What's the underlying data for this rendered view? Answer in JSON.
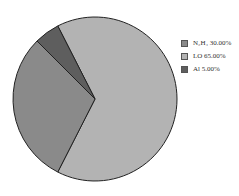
{
  "chart_data": {
    "type": "pie",
    "title": "",
    "categories": [
      "N2H4",
      "LO",
      "Al"
    ],
    "labels": [
      "N₂H₄ 30.00%",
      "LO 65.00%",
      "Al 5.00%"
    ],
    "values": [
      30.0,
      65.0,
      5.0
    ],
    "colors": [
      "#8a8a8a",
      "#b3b3b3",
      "#5e5e5e"
    ],
    "legend_position": "right",
    "start_angle_deg": 333,
    "direction": "clockwise",
    "order": [
      "LO",
      "N2H4",
      "Al"
    ]
  },
  "legend": {
    "items": [
      {
        "label": "N₂H₄ 30.00%",
        "color": "#8a8a8a"
      },
      {
        "label": "LO 65.00%",
        "color": "#b3b3b3"
      },
      {
        "label": "Al 5.00%",
        "color": "#5e5e5e"
      }
    ]
  }
}
